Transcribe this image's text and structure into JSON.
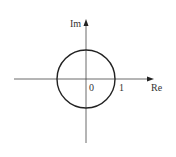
{
  "diagram": {
    "axes": {
      "imaginary_label": "Im",
      "real_label": "Re"
    },
    "labels": {
      "origin": "0",
      "unit": "1"
    },
    "colors": {
      "line": "#222222",
      "axis": "#444444",
      "text": "#333333",
      "background": "#ffffff"
    }
  }
}
